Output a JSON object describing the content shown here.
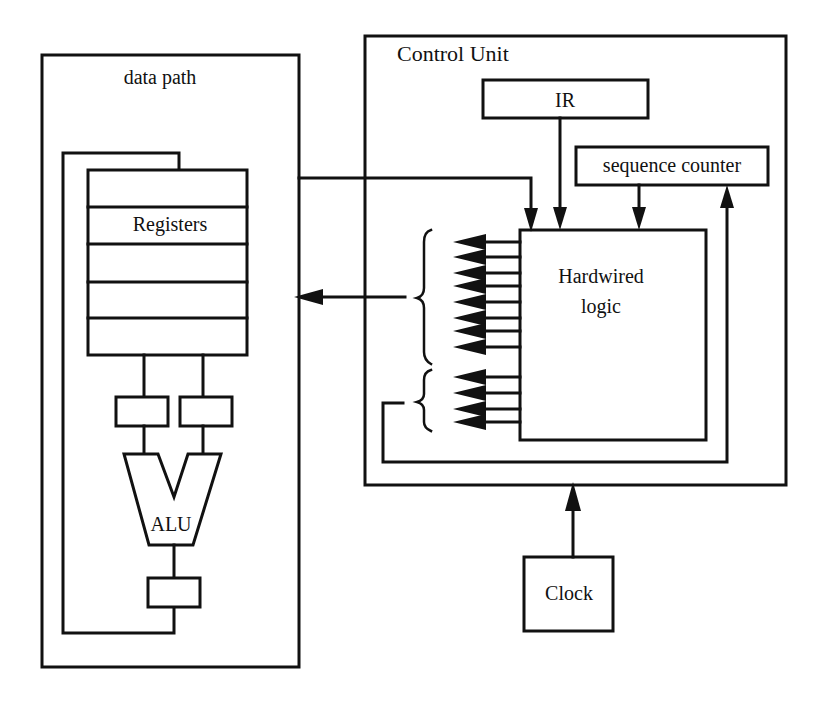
{
  "diagram": {
    "data_path": {
      "label": "data path",
      "registers_label": "Registers",
      "register_rows": 5,
      "alu_label": "ALU"
    },
    "control_unit": {
      "label": "Control Unit",
      "ir_label": "IR",
      "sequence_counter_label": "sequence counter",
      "logic_label_line1": "Hardwired",
      "logic_label_line2": "logic",
      "control_signal_groups": [
        8,
        4
      ]
    },
    "clock_label": "Clock",
    "colors": {
      "stroke": "#111111",
      "background": "#ffffff"
    }
  }
}
